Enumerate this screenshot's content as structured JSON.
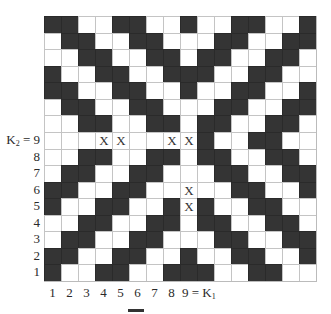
{
  "figure": {
    "rows": [
      "BBWWBBWWBWWBBWWB",
      "WBBWWBBWWWBBWWBB",
      "WWBBWWBBWBBWWBBW",
      "BWWBBWWBBBWWBBWW",
      "BBWWBBWWBWWBBWWB",
      "WBBWWBBWWWBBWWBB",
      "WWBBWWBBWBBWWBBW",
      "WWWXXWWXXBWWBBWW",
      "WWBBWWBBWBBWWBBW",
      "WBBWWBBWWWBBWWBB",
      "BBWWBBWWXWWBBWWB",
      "BWWBBWWBXBWWBBWW",
      "WWBBWWBBWBBWWBBW",
      "WBBWWBBWWWBBWWBB",
      "BBWWBBWWBWWBBWWB",
      "BWWBBWWBBBWWBBWW"
    ],
    "mark_symbol": "X",
    "colors": {
      "filled": "#343434",
      "empty": "#ffffff",
      "gridline": "#c4c4c4"
    },
    "y_axis": {
      "k2_label_main": "K",
      "k2_label_sub": "2",
      "k2_label_suffix": " = 9",
      "labels": [
        "8",
        "7",
        "6",
        "5",
        "4",
        "3",
        "2",
        "1"
      ]
    },
    "x_axis": {
      "labels": [
        "1",
        "2",
        "3",
        "4",
        "5",
        "6",
        "7",
        "8"
      ],
      "k1_label_prefix": "9 = K",
      "k1_label_sub": "1"
    }
  }
}
